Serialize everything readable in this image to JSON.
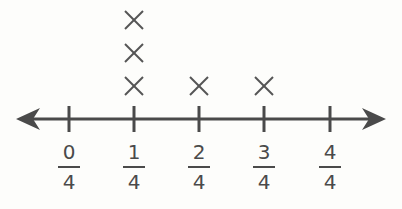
{
  "chart_data": {
    "type": "line_plot",
    "title": "",
    "xlabel": "",
    "ylabel": "",
    "categories": [
      "0/4",
      "1/4",
      "2/4",
      "3/4",
      "4/4"
    ],
    "values": [
      0,
      3,
      1,
      1,
      0
    ],
    "marker": "X",
    "tick_labels": [
      {
        "num": "0",
        "den": "4"
      },
      {
        "num": "1",
        "den": "4"
      },
      {
        "num": "2",
        "den": "4"
      },
      {
        "num": "3",
        "den": "4"
      },
      {
        "num": "4",
        "den": "4"
      }
    ],
    "axis": {
      "arrows": "both",
      "grid": false
    },
    "colors": {
      "line": "#4a4a4a",
      "marker": "#555555"
    }
  }
}
